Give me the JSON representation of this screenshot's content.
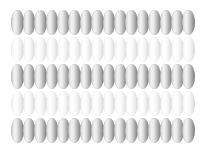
{
  "canvas": {
    "width": 204,
    "height": 154,
    "background_color": "#ffffff"
  },
  "pattern": {
    "name": "ellipse-bead-grid",
    "description": "Grid of vertically oriented shaded ellipses arranged in alternating dark and light rows",
    "rows": 5,
    "columns": 16,
    "grid_left": 12,
    "grid_top": 10,
    "cell_width": 11.4,
    "cell_height": 27,
    "bead_width": 12.6,
    "bead_height": 25,
    "row_shades": [
      "dark",
      "light",
      "dark",
      "light",
      "dark"
    ],
    "colors": {
      "dark_highlight": "#f2f2f2",
      "dark_mid": "#cfcfcf",
      "dark_shadow": "#818181",
      "light_highlight": "#ffffff",
      "light_mid": "#f4f4f4",
      "light_shadow": "#d6d6d6",
      "background": "#ffffff"
    },
    "row_tops": [
      10,
      37,
      64,
      91,
      118
    ]
  },
  "chart_data": {
    "type": "heatmap",
    "title": "",
    "xlabel": "",
    "ylabel": "",
    "categories": [
      "c1",
      "c2",
      "c3",
      "c4",
      "c5",
      "c6",
      "c7",
      "c8",
      "c9",
      "c10",
      "c11",
      "c12",
      "c13",
      "c14",
      "c15",
      "c16"
    ],
    "row_labels": [
      "r1",
      "r2",
      "r3",
      "r4",
      "r5"
    ],
    "series": [
      {
        "name": "r1",
        "values": [
          1,
          1,
          1,
          1,
          1,
          1,
          1,
          1,
          1,
          1,
          1,
          1,
          1,
          1,
          1,
          1
        ]
      },
      {
        "name": "r2",
        "values": [
          0,
          0,
          0,
          0,
          0,
          0,
          0,
          0,
          0,
          0,
          0,
          0,
          0,
          0,
          0,
          0
        ]
      },
      {
        "name": "r3",
        "values": [
          1,
          1,
          1,
          1,
          1,
          1,
          1,
          1,
          1,
          1,
          1,
          1,
          1,
          1,
          1,
          1
        ]
      },
      {
        "name": "r4",
        "values": [
          0,
          0,
          0,
          0,
          0,
          0,
          0,
          0,
          0,
          0,
          0,
          0,
          0,
          0,
          0,
          0
        ]
      },
      {
        "name": "r5",
        "values": [
          1,
          1,
          1,
          1,
          1,
          1,
          1,
          1,
          1,
          1,
          1,
          1,
          1,
          1,
          1,
          1
        ]
      }
    ],
    "legend": [],
    "grid": false
  }
}
